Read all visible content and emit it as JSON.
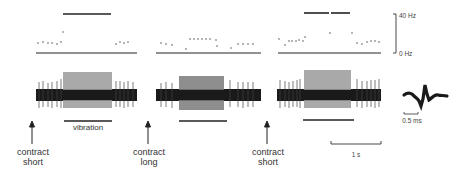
{
  "figure": {
    "panels": [
      {
        "id": "contract-short-1",
        "arrow_label_line1": "contract",
        "arrow_label_line2": "short"
      },
      {
        "id": "contract-long",
        "arrow_label_line1": "contract",
        "arrow_label_line2": "long"
      },
      {
        "id": "contract-short-2",
        "arrow_label_line1": "contract",
        "arrow_label_line2": "short"
      }
    ],
    "vibration_label": "vibration",
    "freq_scale": {
      "top_label": "40 Hz",
      "bottom_label": "0 Hz"
    },
    "time_scale": {
      "label": "1 s"
    },
    "spike_scale": {
      "label": "0.5 ms"
    },
    "colors": {
      "trace_dark": "#1a1a1a",
      "trace_gray": "#8a8a8a",
      "ink": "#222222"
    }
  }
}
